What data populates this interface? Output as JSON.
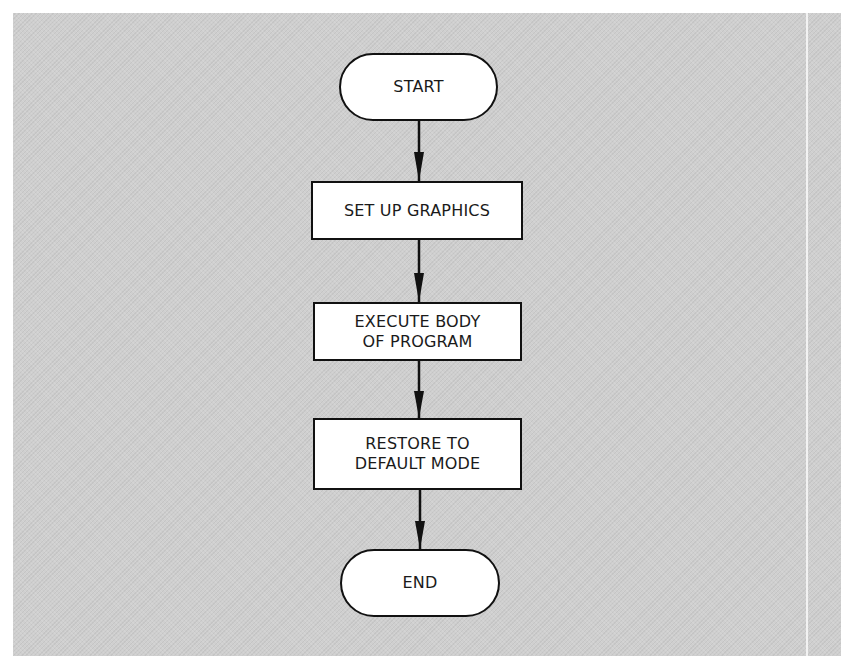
{
  "flowchart": {
    "nodes": [
      {
        "id": "start",
        "shape": "terminator",
        "label": "START"
      },
      {
        "id": "setup",
        "shape": "process",
        "label": "SET UP GRAPHICS"
      },
      {
        "id": "execute",
        "shape": "process",
        "label": "EXECUTE BODY\nOF PROGRAM"
      },
      {
        "id": "restore",
        "shape": "process",
        "label": "RESTORE TO\nDEFAULT MODE"
      },
      {
        "id": "end",
        "shape": "terminator",
        "label": "END"
      }
    ],
    "edges": [
      {
        "from": "start",
        "to": "setup"
      },
      {
        "from": "setup",
        "to": "execute"
      },
      {
        "from": "execute",
        "to": "restore"
      },
      {
        "from": "restore",
        "to": "end"
      }
    ]
  },
  "colors": {
    "background": "#cfcfcf",
    "node_fill": "#ffffff",
    "stroke": "#111111"
  }
}
